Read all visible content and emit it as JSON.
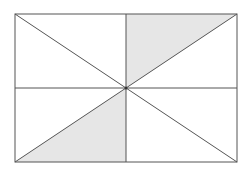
{
  "diagram": {
    "rect": {
      "x": 15,
      "y": 14,
      "width": 222,
      "height": 148
    },
    "center": {
      "x": 126,
      "y": 88
    },
    "colors": {
      "stroke": "#555555",
      "shade": "#e6e6e6",
      "background": "#ffffff"
    },
    "shaded_regions": [
      {
        "name": "top-right-upper-triangle",
        "points": "126,14 237,14 126,88"
      },
      {
        "name": "bottom-left-lower-triangle",
        "points": "15,162 126,88 126,162"
      }
    ]
  }
}
